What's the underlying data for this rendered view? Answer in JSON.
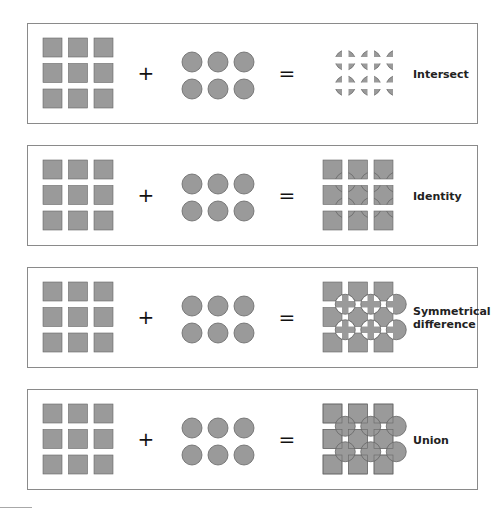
{
  "figure": {
    "fill_color": "#9a9a9a",
    "stroke_color": "#666666",
    "operators": {
      "plus": "+",
      "equals": "="
    },
    "operands": {
      "left": {
        "shape": "square",
        "rows": 3,
        "cols": 3
      },
      "right": {
        "shape": "circle",
        "rows": 2,
        "cols": 3
      }
    },
    "panels": [
      {
        "operation": "intersect",
        "label": "Intersect"
      },
      {
        "operation": "identity",
        "label": "Identity"
      },
      {
        "operation": "symmetrical-difference",
        "label": "Symmetrical difference"
      },
      {
        "operation": "union",
        "label": "Union"
      }
    ]
  }
}
